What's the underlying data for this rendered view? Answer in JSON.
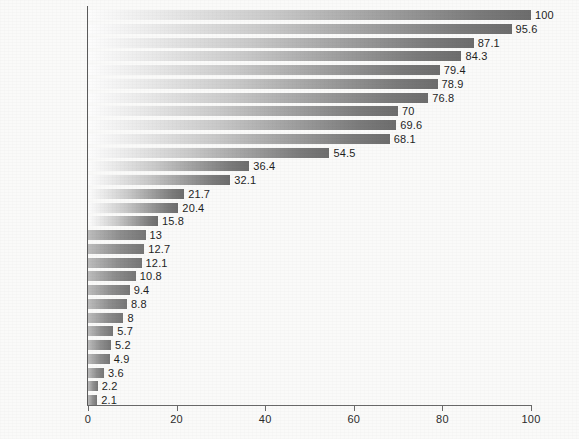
{
  "chart_data": {
    "type": "bar",
    "orientation": "horizontal",
    "title": "",
    "subtitle": "",
    "xlabel": "",
    "ylabel": "",
    "xlim": [
      0,
      100
    ],
    "grid": false,
    "legend": null,
    "xticks": [
      0,
      20,
      40,
      60,
      80,
      100
    ],
    "xtick_labels": [
      "0",
      "20",
      "40",
      "60",
      "80",
      "100"
    ],
    "categories": [
      "USA",
      "Switzerland",
      "Hong Kong",
      "Japan",
      "Belgium",
      "Singapore",
      "France",
      "Netherlands",
      "UK",
      "Germany",
      "Ireland",
      "Greece",
      "Malaysia",
      "Brazil",
      "Russia",
      "Turkey",
      "Peru",
      "Indonesia",
      "Jamaica",
      "Philippines",
      "China",
      "Pakistan",
      "Ghana",
      "Nigeria",
      "Kenya",
      "India",
      "Uganda",
      "Mozambique",
      "Mali"
    ],
    "values": [
      100,
      95.6,
      87.1,
      84.3,
      79.4,
      78.9,
      76.8,
      70,
      69.6,
      68.1,
      54.5,
      36.4,
      32.1,
      21.7,
      20.4,
      15.8,
      13,
      12.7,
      12.1,
      10.8,
      9.4,
      8.8,
      8,
      5.7,
      5.2,
      4.9,
      3.6,
      2.2,
      2.1
    ],
    "value_labels": [
      "100",
      "95.6",
      "87.1",
      "84.3",
      "79.4",
      "78.9",
      "76.8",
      "70",
      "69.6",
      "68.1",
      "54.5",
      "36.4",
      "32.1",
      "21.7",
      "20.4",
      "15.8",
      "13",
      "12.7",
      "12.1",
      "10.8",
      "9.4",
      "8.8",
      "8",
      "5.7",
      "5.2",
      "4.9",
      "3.6",
      "2.2",
      "2.1"
    ]
  },
  "style": {
    "background": "#fafaf9",
    "axis_color": "#5a5a5a",
    "text_color": "#222222",
    "bar_gradient_start": "#fdfdfd",
    "bar_gradient_end": "#6d6d6d"
  }
}
